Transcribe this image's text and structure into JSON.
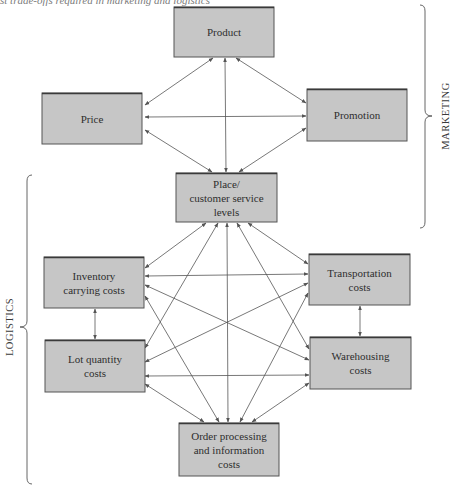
{
  "caption": "st trade-offs required in marketing and logistics",
  "colors": {
    "box_fill": "#c6c6c6",
    "box_border": "#555555",
    "box_top_edge": "#3a3a3a",
    "arrow": "#555555",
    "text": "#2e2e2e",
    "background": "#ffffff"
  },
  "groups": {
    "marketing": {
      "label": "MARKETING"
    },
    "logistics": {
      "label": "LOGISTICS"
    }
  },
  "nodes": [
    {
      "id": "product",
      "lines": [
        "Product"
      ],
      "x": 174,
      "y": 7,
      "w": 100,
      "h": 50
    },
    {
      "id": "price",
      "lines": [
        "Price"
      ],
      "x": 42,
      "y": 93,
      "w": 100,
      "h": 51
    },
    {
      "id": "promotion",
      "lines": [
        "Promotion"
      ],
      "x": 307,
      "y": 89,
      "w": 100,
      "h": 52
    },
    {
      "id": "place",
      "lines": [
        "Place/",
        "customer service",
        "levels"
      ],
      "x": 176,
      "y": 173,
      "w": 101,
      "h": 49
    },
    {
      "id": "inventory",
      "lines": [
        "Inventory",
        "carrying costs"
      ],
      "x": 44,
      "y": 257,
      "w": 100,
      "h": 51
    },
    {
      "id": "transportation",
      "lines": [
        "Transportation",
        "costs"
      ],
      "x": 309,
      "y": 254,
      "w": 101,
      "h": 51
    },
    {
      "id": "lot",
      "lines": [
        "Lot quantity",
        "costs"
      ],
      "x": 45,
      "y": 340,
      "w": 100,
      "h": 52
    },
    {
      "id": "warehousing",
      "lines": [
        "Warehousing",
        "costs"
      ],
      "x": 310,
      "y": 337,
      "w": 101,
      "h": 52
    },
    {
      "id": "order",
      "lines": [
        "Order processing",
        "and information",
        "costs"
      ],
      "x": 179,
      "y": 423,
      "w": 100,
      "h": 53
    }
  ],
  "edges": [
    {
      "from": "product",
      "to": "price",
      "x1": 213,
      "y1": 58,
      "x2": 145,
      "y2": 105
    },
    {
      "from": "product",
      "to": "place",
      "x1": 225,
      "y1": 58,
      "x2": 226,
      "y2": 172
    },
    {
      "from": "product",
      "to": "promotion",
      "x1": 236,
      "y1": 58,
      "x2": 306,
      "y2": 103
    },
    {
      "from": "price",
      "to": "promotion",
      "x1": 145,
      "y1": 117,
      "x2": 306,
      "y2": 116
    },
    {
      "from": "price",
      "to": "place",
      "x1": 145,
      "y1": 130,
      "x2": 212,
      "y2": 172
    },
    {
      "from": "promotion",
      "to": "place",
      "x1": 306,
      "y1": 128,
      "x2": 239,
      "y2": 172
    },
    {
      "from": "place",
      "to": "inventory",
      "x1": 206,
      "y1": 223,
      "x2": 145,
      "y2": 268
    },
    {
      "from": "place",
      "to": "lot",
      "x1": 218,
      "y1": 223,
      "x2": 145,
      "y2": 348
    },
    {
      "from": "place",
      "to": "order",
      "x1": 227,
      "y1": 223,
      "x2": 228,
      "y2": 422
    },
    {
      "from": "place",
      "to": "warehousing",
      "x1": 237,
      "y1": 223,
      "x2": 309,
      "y2": 349
    },
    {
      "from": "place",
      "to": "transportation",
      "x1": 248,
      "y1": 223,
      "x2": 308,
      "y2": 264
    },
    {
      "from": "inventory",
      "to": "transportation",
      "x1": 145,
      "y1": 276,
      "x2": 308,
      "y2": 274
    },
    {
      "from": "inventory",
      "to": "warehousing",
      "x1": 145,
      "y1": 285,
      "x2": 309,
      "y2": 360
    },
    {
      "from": "inventory",
      "to": "order",
      "x1": 145,
      "y1": 296,
      "x2": 219,
      "y2": 422
    },
    {
      "from": "inventory",
      "to": "lot",
      "x1": 95,
      "y1": 309,
      "x2": 95,
      "y2": 339
    },
    {
      "from": "lot",
      "to": "transportation",
      "x1": 145,
      "y1": 362,
      "x2": 308,
      "y2": 283
    },
    {
      "from": "lot",
      "to": "warehousing",
      "x1": 145,
      "y1": 376,
      "x2": 309,
      "y2": 375
    },
    {
      "from": "lot",
      "to": "order",
      "x1": 145,
      "y1": 384,
      "x2": 204,
      "y2": 422
    },
    {
      "from": "transportation",
      "to": "warehousing",
      "x1": 360,
      "y1": 306,
      "x2": 360,
      "y2": 336
    },
    {
      "from": "transportation",
      "to": "order",
      "x1": 308,
      "y1": 293,
      "x2": 240,
      "y2": 422
    },
    {
      "from": "warehousing",
      "to": "order",
      "x1": 309,
      "y1": 383,
      "x2": 252,
      "y2": 422
    }
  ],
  "braces": {
    "marketing": {
      "x": 425,
      "y1": 5,
      "y2": 228,
      "tip_x": 432,
      "tip_y": 116,
      "label_x": 447,
      "label_y": 116
    },
    "logistics": {
      "x": 27,
      "y1": 175,
      "y2": 484,
      "tip_x": 20,
      "tip_y": 327,
      "label_x": 11,
      "label_y": 327
    }
  }
}
